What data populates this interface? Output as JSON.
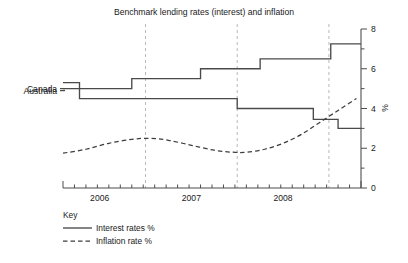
{
  "chart_data": {
    "type": "line",
    "title": "Benchmark lending rates (interest) and inflation",
    "xlabel": "",
    "ylabel": "%",
    "ylim": [
      0,
      8
    ],
    "xlim": [
      2005.6,
      2008.85
    ],
    "y_ticks_major": [
      0,
      2,
      4,
      6,
      8
    ],
    "y_ticks_minor": [
      1,
      3,
      5,
      7
    ],
    "x_tick_labels": [
      "2006",
      "2007",
      "2008"
    ],
    "x_tick_label_positions": [
      2006.0,
      2007.0,
      2008.0
    ],
    "x_axis_boundaries": [
      2005.6,
      2006.5,
      2007.5,
      2008.5,
      2008.85
    ],
    "x_minor_tick_step": 0.125,
    "grid": "vertical-dashed",
    "gridline_positions": [
      2006.5,
      2007.5,
      2008.5
    ],
    "legend_position": "below-left",
    "series": [
      {
        "name": "Canada",
        "style": "step",
        "line": "solid",
        "label": "Canada",
        "points": [
          [
            2005.6,
            5.0
          ],
          [
            2006.35,
            5.0
          ],
          [
            2006.35,
            5.5
          ],
          [
            2007.1,
            5.5
          ],
          [
            2007.1,
            6.0
          ],
          [
            2007.75,
            6.0
          ],
          [
            2007.75,
            6.5
          ],
          [
            2008.52,
            6.5
          ],
          [
            2008.52,
            7.25
          ],
          [
            2008.85,
            7.25
          ]
        ]
      },
      {
        "name": "Australia",
        "style": "step",
        "line": "solid",
        "label": "Australia",
        "points": [
          [
            2005.6,
            5.3
          ],
          [
            2005.78,
            5.3
          ],
          [
            2005.78,
            4.5
          ],
          [
            2007.5,
            4.5
          ],
          [
            2007.5,
            4.0
          ],
          [
            2008.33,
            4.0
          ],
          [
            2008.33,
            3.45
          ],
          [
            2008.6,
            3.45
          ],
          [
            2008.6,
            3.0
          ],
          [
            2008.85,
            3.0
          ]
        ]
      },
      {
        "name": "Inflation rate",
        "style": "smooth",
        "line": "dashed",
        "label": "",
        "points": [
          [
            2005.6,
            1.75
          ],
          [
            2005.85,
            1.95
          ],
          [
            2006.1,
            2.25
          ],
          [
            2006.35,
            2.45
          ],
          [
            2006.55,
            2.5
          ],
          [
            2006.75,
            2.4
          ],
          [
            2007.0,
            2.15
          ],
          [
            2007.25,
            1.9
          ],
          [
            2007.45,
            1.8
          ],
          [
            2007.6,
            1.8
          ],
          [
            2007.8,
            1.95
          ],
          [
            2008.0,
            2.25
          ],
          [
            2008.2,
            2.7
          ],
          [
            2008.4,
            3.3
          ],
          [
            2008.6,
            3.9
          ],
          [
            2008.8,
            4.5
          ]
        ]
      }
    ],
    "series_callouts": [
      {
        "label": "Canada",
        "value": 5.0
      },
      {
        "label": "Australia",
        "value": 4.9
      }
    ]
  },
  "key": {
    "title": "Key",
    "entries": [
      {
        "label": "Interest rates %",
        "style": "solid"
      },
      {
        "label": "Inflation rate %",
        "style": "dashed"
      }
    ]
  }
}
